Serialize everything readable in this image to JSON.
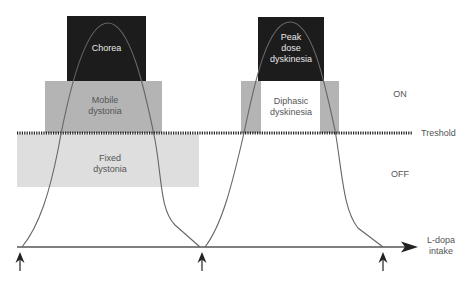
{
  "diagram": {
    "boxes": {
      "chorea": {
        "label": "Chorea",
        "color": "#1c1c1c"
      },
      "mobile_dystonia": {
        "label_line1": "Mobile",
        "label_line2": "dystonia",
        "color": "#b4b4b4"
      },
      "fixed_dystonia": {
        "label_line1": "Fixed",
        "label_line2": "dystonia",
        "color": "#dedede"
      },
      "peak_dose": {
        "label_line1": "Peak",
        "label_line2": "dose",
        "label_line3": "dyskinesia",
        "color": "#1c1c1c"
      },
      "diphasic": {
        "label_line1": "Diphasic",
        "label_line2": "dyskinesia",
        "color": "#b4b4b4",
        "inner_color": "#ffffff"
      }
    },
    "threshold": {
      "label": "Treshold"
    },
    "states": {
      "on": "ON",
      "off": "OFF"
    },
    "axis": {
      "label_line1": "L-dopa",
      "label_line2": "intake"
    },
    "intake_arrows": 3
  }
}
